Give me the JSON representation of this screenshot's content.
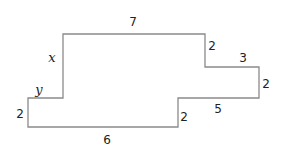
{
  "diagram": {
    "type": "rectilinear-polygon",
    "stroke_color": "#8a8a8a",
    "text_color": "#222222",
    "vertices": [
      [
        63,
        34
      ],
      [
        205,
        34
      ],
      [
        205,
        67
      ],
      [
        259,
        67
      ],
      [
        259,
        98
      ],
      [
        178,
        98
      ],
      [
        178,
        127
      ],
      [
        28,
        127
      ],
      [
        28,
        98
      ],
      [
        63,
        98
      ]
    ],
    "labels": [
      {
        "id": "top",
        "text": "7",
        "x": 133,
        "y": 22,
        "italic": false
      },
      {
        "id": "left-upper",
        "text": "x",
        "x": 52,
        "y": 57,
        "italic": true
      },
      {
        "id": "step-drop",
        "text": "2",
        "x": 212,
        "y": 46,
        "italic": false
      },
      {
        "id": "step-run",
        "text": "3",
        "x": 243,
        "y": 58,
        "italic": false
      },
      {
        "id": "right",
        "text": "2",
        "x": 266,
        "y": 84,
        "italic": false
      },
      {
        "id": "lower-step-run",
        "text": "5",
        "x": 218,
        "y": 109,
        "italic": false
      },
      {
        "id": "lower-step-drop",
        "text": "2",
        "x": 184,
        "y": 117,
        "italic": false
      },
      {
        "id": "bottom",
        "text": "6",
        "x": 107,
        "y": 140,
        "italic": false
      },
      {
        "id": "left-lower",
        "text": "2",
        "x": 20,
        "y": 114,
        "italic": false
      },
      {
        "id": "notch",
        "text": "y",
        "x": 39,
        "y": 89,
        "italic": true
      }
    ]
  }
}
